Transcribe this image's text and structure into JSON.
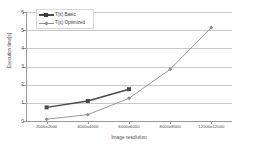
{
  "chart_data": {
    "type": "line",
    "title": "",
    "subtitle": "",
    "xlabel": "Image resolution",
    "ylabel": "Execution time[s]",
    "categories": [
      "2000x2000",
      "4000x4000",
      "6000x6000",
      "8000x8000",
      "12000x12000"
    ],
    "series": [
      {
        "name": "T(s) Basic",
        "color": "#4a4a4a",
        "marker": "square",
        "values": [
          0.75,
          1.1,
          1.75,
          null,
          null
        ]
      },
      {
        "name": "T(s) Optimized",
        "color": "#8e8e8e",
        "marker": "diamond",
        "values": [
          0.1,
          0.35,
          1.25,
          2.85,
          5.15
        ]
      }
    ],
    "ylim": [
      0,
      6
    ],
    "yticks": [
      0,
      1,
      2,
      3,
      4,
      5,
      6
    ],
    "ytick_labels": [
      "0",
      "1",
      "2",
      "3",
      "4",
      "5",
      "6"
    ],
    "grid": "horizontal",
    "legend_position": "top-left"
  },
  "legend": {
    "entries": [
      {
        "label": "T(s) Basic"
      },
      {
        "label": "T(s) Optimized"
      }
    ]
  },
  "colors": {
    "basic": "#4a4a4a",
    "optimized": "#8e8e8e",
    "gridline": "#c9c9c9",
    "axis": "#9a9a9a",
    "background": "#ffffff",
    "text": "#3a3a3a"
  }
}
